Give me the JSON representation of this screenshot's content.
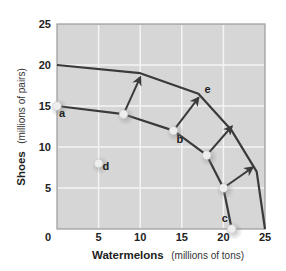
{
  "chart_data": {
    "type": "line",
    "title": "",
    "xlabel": "Watermelons",
    "xlabel_unit": "(millions of tons)",
    "ylabel": "Shoes",
    "ylabel_unit": "(millions of pairs)",
    "xlim": [
      0,
      25
    ],
    "ylim": [
      0,
      25
    ],
    "xticks": [
      0,
      5,
      10,
      15,
      20,
      25
    ],
    "yticks": [
      0,
      5,
      10,
      15,
      20,
      25
    ],
    "grid": true,
    "legend": null,
    "series": [
      {
        "name": "Production possibilities frontier (original)",
        "points": [
          [
            0,
            15
          ],
          [
            8,
            14
          ],
          [
            14,
            12
          ],
          [
            18,
            9
          ],
          [
            20,
            5
          ],
          [
            21,
            0
          ]
        ],
        "markers": true
      },
      {
        "name": "Production possibilities frontier (shifted outward, e)",
        "points": [
          [
            0,
            20
          ],
          [
            10,
            19
          ],
          [
            17,
            16.5
          ],
          [
            21,
            12
          ],
          [
            24,
            7
          ],
          [
            25,
            0
          ]
        ],
        "markers": false
      }
    ],
    "standalone_points": [
      {
        "label": "d",
        "x": 5,
        "y": 8
      }
    ],
    "point_labels": [
      {
        "label": "a",
        "x": 0,
        "y": 15
      },
      {
        "label": "b",
        "x": 14,
        "y": 12
      },
      {
        "label": "c",
        "x": 21,
        "y": 0
      },
      {
        "label": "e",
        "x": 17,
        "y": 16.5
      }
    ],
    "arrows": [
      {
        "from": [
          8,
          14
        ],
        "to": [
          10,
          18.5
        ]
      },
      {
        "from": [
          14,
          12
        ],
        "to": [
          17,
          16
        ]
      },
      {
        "from": [
          18,
          9
        ],
        "to": [
          21,
          12.5
        ]
      },
      {
        "from": [
          20,
          5
        ],
        "to": [
          23.5,
          7.5
        ]
      }
    ]
  },
  "colors": {
    "plot_background": "#d6d6d6",
    "grid": "#f4f4f4",
    "curve": "#3a3a3a",
    "marker": "#eeeeee",
    "border": "#9a9a9a"
  },
  "axis": {
    "x_title": "Watermelons",
    "x_unit": "(millions of tons)",
    "y_title": "Shoes",
    "y_unit": "(millions of pairs)"
  }
}
